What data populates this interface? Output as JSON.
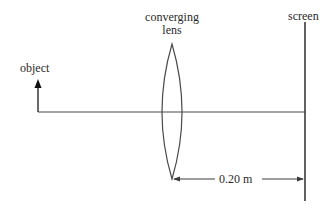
{
  "diagram": {
    "type": "optics-ray-setup",
    "labels": {
      "object": "object",
      "lens_line1": "converging",
      "lens_line2": "lens",
      "screen": "screen",
      "distance": "0.20 m"
    },
    "colors": {
      "line": "#3a3a3a",
      "text": "#2a2a2a",
      "background": "#ffffff"
    }
  }
}
